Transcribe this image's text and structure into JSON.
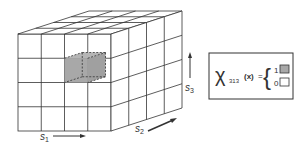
{
  "diagram": {
    "grid": {
      "cols": 4,
      "rows": 4,
      "depth": 4
    },
    "axes": {
      "s1": {
        "label": "s",
        "sub": "1"
      },
      "s2": {
        "label": "s",
        "sub": "2"
      },
      "s3": {
        "label": "s",
        "sub": "3"
      }
    },
    "highlighted_cell": {
      "index": "313",
      "color": "#a8a8a8"
    },
    "legend": {
      "symbol": "χ",
      "subscript": "313",
      "argument": "(x)",
      "equals": "=",
      "brace": "{",
      "values": [
        {
          "value": "1",
          "swatch": "#a8a8a8",
          "meaning": "filled"
        },
        {
          "value": "0",
          "swatch": "#ffffff",
          "meaning": "empty"
        }
      ]
    },
    "colors": {
      "line": "#333333",
      "shade": "#a8a8a8",
      "background": "#ffffff"
    }
  }
}
